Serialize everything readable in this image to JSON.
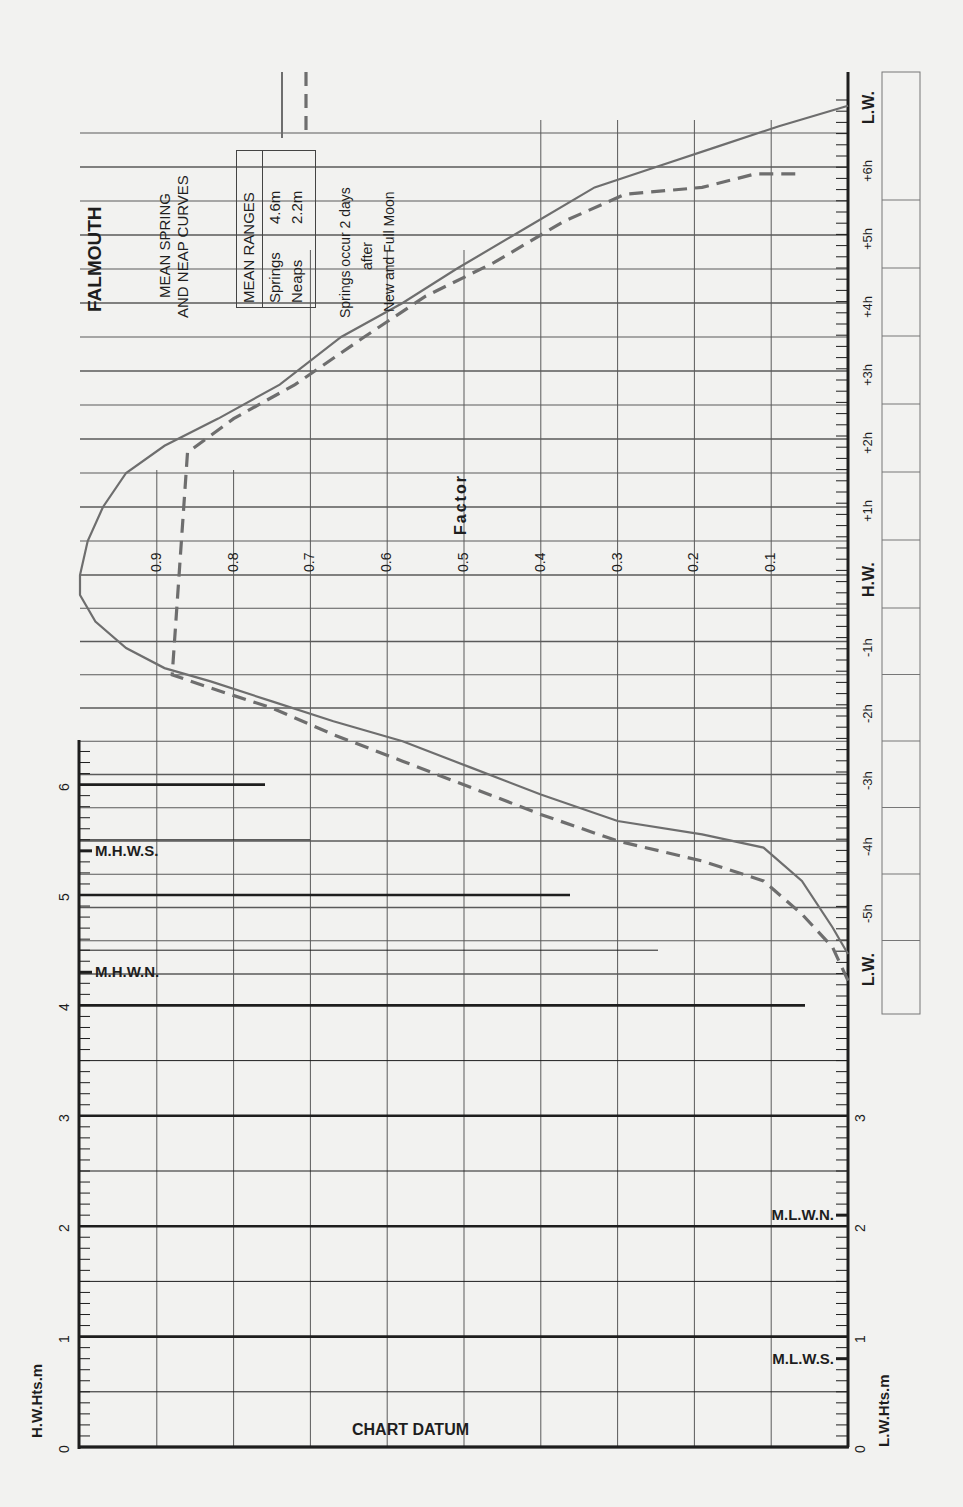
{
  "title": "FALMOUTH",
  "subtitle_line1": "MEAN SPRING",
  "subtitle_line2": "AND NEAP CURVES",
  "legend": {
    "header": "MEAN RANGES",
    "springs_label": "Springs",
    "springs_value": "4.6m",
    "neaps_label": "Neaps",
    "neaps_value": "2.2m",
    "springs_style": "solid",
    "neaps_style": "dashed"
  },
  "note": {
    "line1": "Springs occur 2 days",
    "line2": "after",
    "line3": "New and Full Moon"
  },
  "factor_label": "Factor",
  "chart_datum_label": "CHART DATUM",
  "hw_axis_label": "H.W.Hts.m",
  "lw_axis_label": "L.W.Hts.m",
  "hw_marks": [
    {
      "label": "M.H.W.S.",
      "value": 5.4
    },
    {
      "label": "M.H.W.N.",
      "value": 4.3
    }
  ],
  "lw_marks": [
    {
      "label": "M.L.W.N.",
      "value": 2.1
    },
    {
      "label": "M.L.W.S.",
      "value": 0.8
    }
  ],
  "colors": {
    "background": "#f2f2f0",
    "ink": "#1e1e1e",
    "grid": "#5a5a5a",
    "curve": "#6e6e6e"
  },
  "chart_data": {
    "type": "line",
    "xlabel": "Time relative to High Water (hours)",
    "ylabel": "Factor",
    "x_tick_labels": [
      "L.W.",
      "-5h",
      "-4h",
      "-3h",
      "-2h",
      "-1h",
      "H.W.",
      "+1h",
      "+2h",
      "+3h",
      "+4h",
      "+5h",
      "+6h",
      "L.W."
    ],
    "factor_ticks": [
      "0.1",
      "0.2",
      "0.3",
      "0.4",
      "0.5",
      "0.6",
      "0.7",
      "0.8",
      "0.9"
    ],
    "hw_height_ticks": [
      "0",
      "1",
      "2",
      "3",
      "4",
      "5",
      "6"
    ],
    "lw_height_ticks": [
      "0",
      "1",
      "2",
      "3"
    ],
    "ylim": [
      0,
      1
    ],
    "xlim": [
      -6,
      6.8
    ],
    "grid": true,
    "legend_position": "top-left",
    "series": [
      {
        "name": "Springs (4.6m)",
        "style": "solid",
        "points": [
          [
            -5.7,
            0.0
          ],
          [
            -5.3,
            0.02
          ],
          [
            -4.6,
            0.06
          ],
          [
            -4.1,
            0.11
          ],
          [
            -3.9,
            0.19
          ],
          [
            -3.7,
            0.3
          ],
          [
            -3.3,
            0.4
          ],
          [
            -2.9,
            0.49
          ],
          [
            -2.5,
            0.58
          ],
          [
            -2.2,
            0.67
          ],
          [
            -1.9,
            0.75
          ],
          [
            -1.6,
            0.83
          ],
          [
            -1.4,
            0.89
          ],
          [
            -1.1,
            0.94
          ],
          [
            -0.7,
            0.98
          ],
          [
            -0.3,
            1.0
          ],
          [
            0.0,
            1.0
          ],
          [
            0.5,
            0.99
          ],
          [
            1.0,
            0.97
          ],
          [
            1.5,
            0.94
          ],
          [
            1.9,
            0.89
          ],
          [
            2.3,
            0.82
          ],
          [
            2.8,
            0.74
          ],
          [
            3.5,
            0.66
          ],
          [
            4.0,
            0.58
          ],
          [
            4.5,
            0.51
          ],
          [
            5.1,
            0.42
          ],
          [
            5.7,
            0.33
          ],
          [
            6.0,
            0.25
          ],
          [
            6.3,
            0.17
          ],
          [
            6.6,
            0.09
          ],
          [
            6.9,
            0.0
          ]
        ]
      },
      {
        "name": "Neaps (2.2m)",
        "style": "dashed",
        "points": [
          [
            -6.1,
            0.0
          ],
          [
            -5.6,
            0.02
          ],
          [
            -5.1,
            0.06
          ],
          [
            -4.6,
            0.11
          ],
          [
            -4.3,
            0.19
          ],
          [
            -4.0,
            0.3
          ],
          [
            -3.6,
            0.4
          ],
          [
            -3.2,
            0.49
          ],
          [
            -2.8,
            0.58
          ],
          [
            -2.4,
            0.67
          ],
          [
            -2.0,
            0.75
          ],
          [
            -1.7,
            0.83
          ],
          [
            -1.5,
            0.88
          ],
          [
            1.8,
            0.86
          ],
          [
            2.3,
            0.8
          ],
          [
            2.8,
            0.72
          ],
          [
            3.5,
            0.63
          ],
          [
            4.1,
            0.55
          ],
          [
            4.6,
            0.46
          ],
          [
            5.2,
            0.37
          ],
          [
            5.6,
            0.29
          ],
          [
            5.7,
            0.19
          ],
          [
            5.9,
            0.12
          ],
          [
            5.9,
            0.06
          ]
        ]
      }
    ]
  }
}
